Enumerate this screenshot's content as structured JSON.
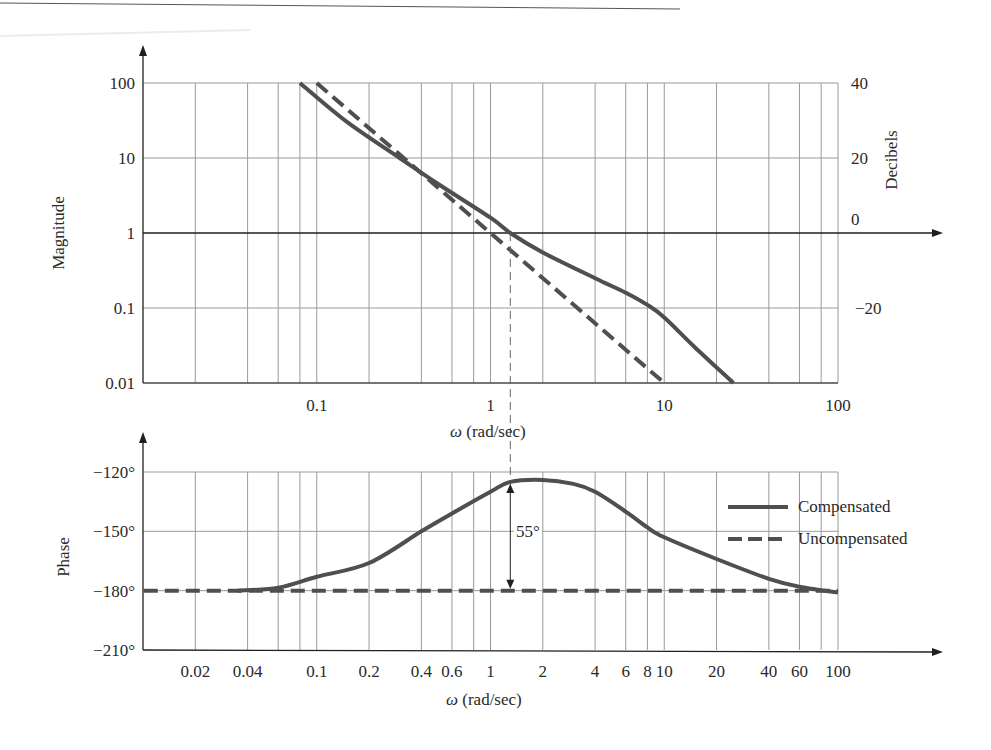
{
  "chart_data": [
    {
      "type": "line",
      "title": "",
      "xscale": "log",
      "yscale": "log",
      "xlabel": "ω (rad/sec)",
      "ylabel": "Magnitude",
      "y2label": "Decibels",
      "xlim": [
        0.01,
        100
      ],
      "ylim": [
        0.01,
        100
      ],
      "x_tick_labels": [
        "0.1",
        "1",
        "10",
        "100"
      ],
      "x_ticks": [
        0.1,
        1,
        10,
        100
      ],
      "y_tick_labels": [
        "100",
        "10",
        "1",
        "0.1",
        "0.01"
      ],
      "y_ticks": [
        100,
        10,
        1,
        0.1,
        0.01
      ],
      "y2_tick_labels": [
        "40",
        "20",
        "0",
        "−20"
      ],
      "y2_ticks": [
        40,
        20,
        0,
        -20
      ],
      "grid": true,
      "grid_x": [
        0.02,
        0.04,
        0.06,
        0.08,
        0.1,
        0.2,
        0.4,
        0.6,
        0.8,
        1,
        2,
        4,
        6,
        8,
        10,
        20,
        40,
        60,
        80,
        100
      ],
      "series": [
        {
          "name": "Compensated",
          "style": "solid",
          "x": [
            0.08,
            0.15,
            0.3,
            0.5,
            1.0,
            1.3,
            2.0,
            4.0,
            6.0,
            8.0,
            10.0,
            15.0,
            25.0
          ],
          "y": [
            100,
            30,
            10,
            4.5,
            1.6,
            1.0,
            0.55,
            0.25,
            0.16,
            0.11,
            0.075,
            0.03,
            0.01
          ]
        },
        {
          "name": "Uncompensated",
          "style": "dashed",
          "x": [
            0.1,
            1.0,
            10.0
          ],
          "y": [
            100,
            1,
            0.01
          ]
        }
      ],
      "annotations": [
        {
          "type": "vertical-dashed",
          "x": 1.3,
          "label": "gain crossover"
        }
      ]
    },
    {
      "type": "line",
      "title": "",
      "xscale": "log",
      "xlabel": "ω (rad/sec)",
      "ylabel": "Phase",
      "xlim": [
        0.01,
        100
      ],
      "ylim": [
        -210,
        -120
      ],
      "x_tick_labels": [
        "0.02",
        "0.04",
        "0.1",
        "0.2",
        "0.4",
        "0.6",
        "1",
        "2",
        "4",
        "6",
        "8",
        "10",
        "20",
        "40",
        "60",
        "100"
      ],
      "x_ticks": [
        0.02,
        0.04,
        0.1,
        0.2,
        0.4,
        0.6,
        1,
        2,
        4,
        6,
        8,
        10,
        20,
        40,
        60,
        100
      ],
      "y_tick_labels": [
        "−120°",
        "−150°",
        "−180°",
        "−210°"
      ],
      "y_ticks": [
        -120,
        -150,
        -180,
        -210
      ],
      "grid": true,
      "grid_x": [
        0.02,
        0.04,
        0.06,
        0.08,
        0.1,
        0.2,
        0.4,
        0.6,
        0.8,
        1,
        2,
        4,
        6,
        8,
        10,
        20,
        40,
        60,
        80,
        100
      ],
      "series": [
        {
          "name": "Compensated",
          "style": "solid",
          "x": [
            0.035,
            0.06,
            0.1,
            0.2,
            0.4,
            0.6,
            1.0,
            1.3,
            2.0,
            3.0,
            4.0,
            6.0,
            8.0,
            10.0,
            20.0,
            40.0,
            60.0,
            100.0
          ],
          "y": [
            -180,
            -178.5,
            -173,
            -166,
            -150,
            -141,
            -130,
            -125,
            -124,
            -126,
            -130,
            -140,
            -148,
            -153,
            -164,
            -174,
            -178,
            -181
          ]
        },
        {
          "name": "Uncompensated",
          "style": "dashed",
          "x": [
            0.01,
            100
          ],
          "y": [
            -180,
            -180
          ]
        }
      ],
      "annotations": [
        {
          "type": "double-arrow",
          "x": 1.3,
          "from": -180,
          "to": -125,
          "label": "55°"
        }
      ],
      "legend": {
        "position": "right-inside",
        "entries": [
          "Compensated",
          "Uncompensated"
        ]
      }
    }
  ],
  "labels": {
    "mag_ylabel": "Magnitude",
    "db_ylabel": "Decibels",
    "mag_xlabel_omega": "ω",
    "mag_xlabel_unit": " (rad/sec)",
    "phase_ylabel": "Phase",
    "phase_xlabel_omega": "ω",
    "phase_xlabel_unit": " (rad/sec)",
    "margin_annotation": "55°",
    "legend_compensated": "Compensated",
    "legend_uncompensated": "Uncompensated"
  },
  "colors": {
    "curve": "#4f4f4f",
    "grid": "#9a9a9a",
    "axis": "#1f1f1f",
    "background": "#ffffff"
  }
}
